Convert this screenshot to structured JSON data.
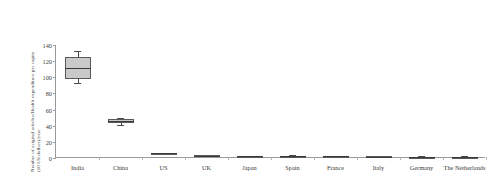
{
  "chart_data": {
    "type": "box",
    "title": "",
    "xlabel": "",
    "ylabel_line1": "Number of original articles/Health expenditure per capita",
    "ylabel_line2": "(10 US dollars)/year",
    "ylim": [
      0,
      140
    ],
    "yticks": [
      0,
      20,
      40,
      60,
      80,
      100,
      120,
      140
    ],
    "grid": false,
    "legend": "none",
    "categories": [
      "India",
      "China",
      "US",
      "UK",
      "Japan",
      "Spain",
      "France",
      "Italy",
      "Germany",
      "The Netherlands"
    ],
    "boxes": [
      {
        "category": "India",
        "min": 93.0,
        "q1": 98.0,
        "median": 112.0,
        "q3": 125.0,
        "max": 133.0
      },
      {
        "category": "China",
        "min": 41.0,
        "q1": 43.5,
        "median": 46.0,
        "q3": 48.5,
        "max": 50.0
      },
      {
        "category": "US",
        "min": 5.2,
        "q1": 5.6,
        "median": 6.0,
        "q3": 6.4,
        "max": 6.8
      },
      {
        "category": "UK",
        "min": 2.4,
        "q1": 2.7,
        "median": 3.0,
        "q3": 3.3,
        "max": 3.6
      },
      {
        "category": "Japan",
        "min": 1.7,
        "q1": 1.9,
        "median": 2.1,
        "q3": 2.3,
        "max": 2.5
      },
      {
        "category": "Spain",
        "min": 2.0,
        "q1": 2.3,
        "median": 2.6,
        "q3": 2.9,
        "max": 3.2
      },
      {
        "category": "France",
        "min": 1.5,
        "q1": 1.7,
        "median": 1.9,
        "q3": 2.1,
        "max": 2.3
      },
      {
        "category": "Italy",
        "min": 1.3,
        "q1": 1.5,
        "median": 1.7,
        "q3": 1.9,
        "max": 2.1
      },
      {
        "category": "Germany",
        "min": 1.2,
        "q1": 1.4,
        "median": 1.6,
        "q3": 1.8,
        "max": 2.0
      },
      {
        "category": "The Netherlands",
        "min": 1.1,
        "q1": 1.3,
        "median": 1.5,
        "q3": 1.7,
        "max": 1.9
      }
    ],
    "colors": {
      "box_fill": "#c9c9c9",
      "box_stroke": "#5a5a5a",
      "median": "#3a3a3a",
      "whisker": "#4a4a4a",
      "axis": "#9a9a9a",
      "text": "#3a3a3a",
      "background": "#ffffff"
    }
  }
}
